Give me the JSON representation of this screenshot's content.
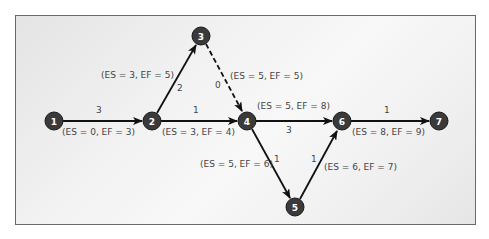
{
  "diagram": {
    "type": "activity-on-arrow network",
    "colors": {
      "node_fill": "#3a3a3a",
      "node_stroke": "#1a1a1a",
      "arrow": "#111111",
      "text": "#444444",
      "frame": "#6a6a6a"
    },
    "nodes": [
      {
        "id": "1",
        "label": "1",
        "x": 54,
        "y": 121
      },
      {
        "id": "2",
        "label": "2",
        "x": 152,
        "y": 121
      },
      {
        "id": "3",
        "label": "3",
        "x": 201,
        "y": 36
      },
      {
        "id": "4",
        "label": "4",
        "x": 247,
        "y": 121
      },
      {
        "id": "5",
        "label": "5",
        "x": 295,
        "y": 207
      },
      {
        "id": "6",
        "label": "6",
        "x": 342,
        "y": 121
      },
      {
        "id": "7",
        "label": "7",
        "x": 439,
        "y": 121
      }
    ],
    "edges": [
      {
        "from": "1",
        "to": "2",
        "duration": "3",
        "times": "(ES = 0, EF = 3)",
        "dashed": false
      },
      {
        "from": "2",
        "to": "3",
        "duration": "2",
        "times": "(ES = 3, EF = 5)",
        "dashed": false
      },
      {
        "from": "2",
        "to": "4",
        "duration": "1",
        "times": "(ES = 3, EF = 4)",
        "dashed": false
      },
      {
        "from": "3",
        "to": "4",
        "duration": "0",
        "times": "(ES = 5, EF = 5)",
        "dashed": true
      },
      {
        "from": "4",
        "to": "6",
        "duration": "3",
        "times": "(ES = 5, EF = 8)",
        "dashed": false
      },
      {
        "from": "4",
        "to": "5",
        "duration": "1",
        "times": "(ES = 5, EF = 6)",
        "dashed": false
      },
      {
        "from": "5",
        "to": "6",
        "duration": "1",
        "times": "(ES = 6, EF = 7)",
        "dashed": false
      },
      {
        "from": "6",
        "to": "7",
        "duration": "1",
        "times": "(ES = 8, EF = 9)",
        "dashed": false
      }
    ]
  }
}
